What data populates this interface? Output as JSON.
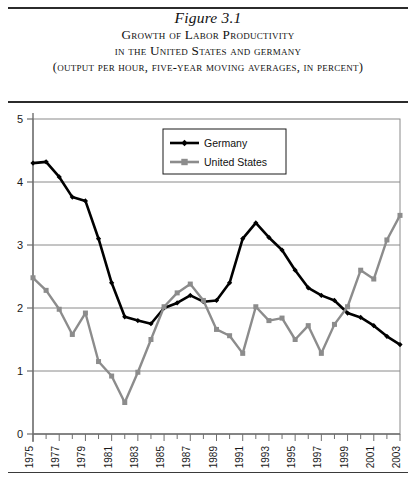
{
  "title": {
    "figure_label": "Figure 3.1",
    "line1": "Growth of Labor Productivity",
    "line2": "in the United States and germany",
    "line3": "(output per hour, five-year moving averages, in percent)"
  },
  "legend": {
    "position": "upper-center",
    "items": [
      {
        "label": "Germany",
        "color": "#000000",
        "marker": "diamond"
      },
      {
        "label": "United States",
        "color": "#8c8c8c",
        "marker": "square"
      }
    ]
  },
  "axes": {
    "y_ticks": [
      "0",
      "1",
      "2",
      "3",
      "4",
      "5"
    ],
    "x_ticks": [
      "1975",
      "1977",
      "1979",
      "1981",
      "1983",
      "1985",
      "1987",
      "1989",
      "1991",
      "1993",
      "1995",
      "1997",
      "1999",
      "2001",
      "2003"
    ]
  },
  "colors": {
    "germany": "#000000",
    "united_states": "#8c8c8c",
    "gridline": "#8a8a8a",
    "axis": "#6f6f6f",
    "rule": "#2b2b2b"
  },
  "chart_data": {
    "type": "line",
    "title": "Growth of Labor Productivity in the United States and germany",
    "subtitle": "(output per hour, five-year moving averages, in percent)",
    "xlabel": "",
    "ylabel": "",
    "ylim": [
      0,
      5
    ],
    "xlim": [
      1975,
      2003
    ],
    "grid": true,
    "legend_position": "upper-center",
    "x": [
      1975,
      1976,
      1977,
      1978,
      1979,
      1980,
      1981,
      1982,
      1983,
      1984,
      1985,
      1986,
      1987,
      1988,
      1989,
      1990,
      1991,
      1992,
      1993,
      1994,
      1995,
      1996,
      1997,
      1998,
      1999,
      2000,
      2001,
      2002,
      2003
    ],
    "series": [
      {
        "name": "Germany",
        "color": "#000000",
        "marker": "diamond",
        "values": [
          4.3,
          4.32,
          4.08,
          3.76,
          3.7,
          3.1,
          2.4,
          1.86,
          1.8,
          1.75,
          2.0,
          2.08,
          2.2,
          2.1,
          2.12,
          2.4,
          3.1,
          3.35,
          3.12,
          2.92,
          2.6,
          2.32,
          2.2,
          2.12,
          1.92,
          1.85,
          1.72,
          1.55,
          1.42
        ]
      },
      {
        "name": "United States",
        "color": "#8c8c8c",
        "marker": "square",
        "values": [
          2.48,
          2.28,
          1.98,
          1.58,
          1.92,
          1.15,
          0.92,
          0.5,
          0.98,
          1.5,
          2.02,
          2.24,
          2.38,
          2.12,
          1.66,
          1.56,
          1.28,
          2.02,
          1.8,
          1.84,
          1.5,
          1.72,
          1.28,
          1.74,
          2.02,
          2.6,
          2.46,
          3.08,
          3.47
        ]
      }
    ]
  }
}
